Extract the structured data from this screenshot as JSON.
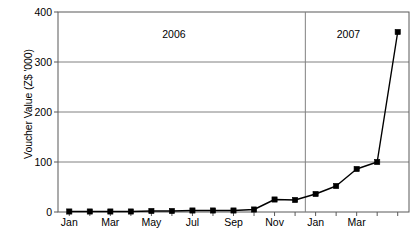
{
  "chart_data": {
    "type": "line",
    "title": "",
    "xlabel": "",
    "ylabel": "Voucher Value (Z$ '000)",
    "ylim": [
      0,
      400
    ],
    "yticks": [
      0,
      100,
      200,
      300,
      400
    ],
    "ytick_labels": [
      "0",
      "100",
      "200",
      "300",
      "400"
    ],
    "grid": true,
    "legend": false,
    "x": [
      "Jan",
      "Feb",
      "Mar",
      "Apr",
      "May",
      "Jun",
      "Jul",
      "Aug",
      "Sep",
      "Oct",
      "Nov",
      "Dec",
      "Jan",
      "Feb",
      "Mar",
      "Apr",
      "May"
    ],
    "xtick_labels": [
      "Jan",
      "Mar",
      "May",
      "Jul",
      "Sep",
      "Nov",
      "Jan",
      "Mar"
    ],
    "xtick_indices": [
      0,
      2,
      4,
      6,
      8,
      10,
      12,
      14
    ],
    "values": [
      1,
      1,
      1,
      1,
      2,
      2,
      3,
      3,
      3,
      5,
      25,
      24,
      36,
      52,
      86,
      100,
      360
    ],
    "series_name": "Voucher Value",
    "marker": "square",
    "line_color": "#000000",
    "marker_color": "#000000",
    "grid_color": "#808080",
    "axis_color": "#595959",
    "annotations": [
      {
        "text": "2006",
        "x_index": 5.1,
        "y_value": 357
      },
      {
        "text": "2007",
        "x_index": 13.6,
        "y_value": 357
      }
    ],
    "divider": {
      "x_index": 11.5,
      "label": "year-boundary-2006-2007"
    }
  }
}
